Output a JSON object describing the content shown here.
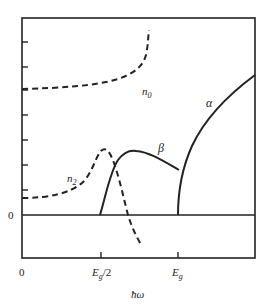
{
  "figure": {
    "type": "diagram",
    "colors": {
      "ink": "#222222",
      "background": "#ffffff"
    }
  },
  "axes": {
    "x_label": "ħω",
    "x_ticks": [
      {
        "label": "0",
        "pos": 0
      },
      {
        "label": "Eg/2",
        "pos": 0.5
      },
      {
        "label": "Eg",
        "pos": 1
      }
    ],
    "x_tick_labels": {
      "zero": "0",
      "half_gap_base": "E",
      "half_gap_sub": "g",
      "half_gap_suffix": "/2",
      "gap_base": "E",
      "gap_sub": "g"
    },
    "y_zero_label": "0",
    "y_tick_count": 7
  },
  "curves": [
    {
      "name": "n0",
      "label_base": "n",
      "label_sub": "0",
      "style": "dashed",
      "description": "linear refractive index, rising toward resonance"
    },
    {
      "name": "n2",
      "label_base": "n",
      "label_sub": "2",
      "style": "dashed",
      "description": "nonlinear refractive index, peaks near Eg/2 then turns negative"
    },
    {
      "name": "beta",
      "label": "β",
      "style": "solid",
      "description": "two-photon absorption, onset at Eg/2"
    },
    {
      "name": "alpha",
      "label": "α",
      "style": "solid",
      "description": "linear absorption, onset at Eg"
    }
  ]
}
